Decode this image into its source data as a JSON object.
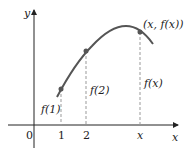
{
  "axes": {
    "x_label": "x",
    "y_label": "y",
    "origin_label": "0",
    "x_ticks": [
      "1",
      "2",
      "x"
    ]
  },
  "points": [
    {
      "label": "f(1)",
      "tick": "1"
    },
    {
      "label": "f(2)",
      "tick": "2"
    },
    {
      "label": "f(x)",
      "tick": "x",
      "point_label": "(x, f(x))"
    }
  ],
  "colors": {
    "curve": "#555555",
    "axis": "#222222",
    "dashed": "#999999"
  }
}
